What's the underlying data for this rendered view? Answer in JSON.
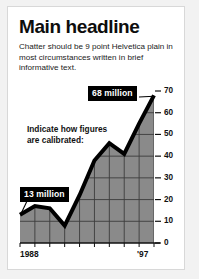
{
  "card": {
    "headline": "Main headline",
    "chatter": "Chatter should be 9 point Helvetica plain in most circumstances written in brief informative text.",
    "annotation": "Indicate how figures are calibrated:",
    "callout_low": "13 million",
    "callout_high": "68 million"
  },
  "colors": {
    "page_background": "#f2f2f2",
    "card_background": "#ffffff",
    "card_border": "#d8d8d8",
    "text": "#111111",
    "area_fill": "#8a8a8a",
    "grid_line": "#3c3c3c",
    "curve": "#000000",
    "badge_background": "#000000",
    "badge_text": "#ffffff"
  },
  "chart_data": {
    "type": "area",
    "title": "",
    "xlabel": "",
    "ylabel": "",
    "x_start_label": "1988",
    "x_end_label": "'97",
    "categories": [
      "1988",
      "1989",
      "1990",
      "1991",
      "1992",
      "1993",
      "1994",
      "1995",
      "1996",
      "'97"
    ],
    "values": [
      13,
      17,
      16,
      8,
      22,
      38,
      46,
      41,
      55,
      68
    ],
    "ylim": [
      0,
      70
    ],
    "yticks": [
      0,
      10,
      20,
      30,
      40,
      50,
      60,
      70
    ],
    "ytick_labels": [
      "0",
      "10",
      "20",
      "30",
      "40",
      "50",
      "60",
      "70"
    ],
    "grid": true,
    "legend": null,
    "annotations": [
      {
        "label": "13 million",
        "x": "1988",
        "value": 13
      },
      {
        "label": "68 million",
        "x": "'97",
        "value": 68
      }
    ]
  }
}
